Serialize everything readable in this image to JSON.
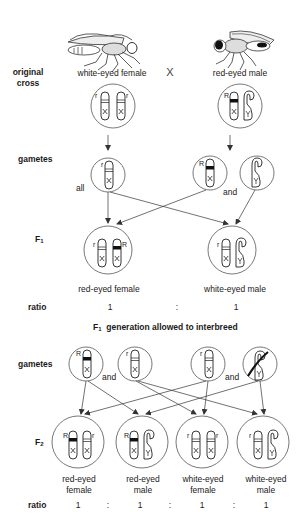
{
  "original_cross": {
    "row_label_line1": "original",
    "row_label_line2": "cross",
    "female_label": "white-eyed female",
    "cross_symbol": "X",
    "male_label": "red-eyed male",
    "female_fly_icon": "white-eyed-fly-icon",
    "male_fly_icon": "red-eyed-fly-icon",
    "female_chromosomes": [
      {
        "allele": "r",
        "type": "X"
      },
      {
        "allele": "r",
        "type": "X"
      }
    ],
    "male_chromosomes": [
      {
        "allele": "R",
        "type": "X"
      },
      {
        "allele": "",
        "type": "Y"
      }
    ]
  },
  "gametes_1": {
    "row_label": "gametes",
    "female_note": "all",
    "male_conjunction": "and",
    "female_gamete": {
      "allele": "r",
      "type": "X"
    },
    "male_gametes": [
      {
        "allele": "R",
        "type": "X"
      },
      {
        "allele": "",
        "type": "Y"
      }
    ]
  },
  "f1": {
    "row_label": "F",
    "row_label_sub": "1",
    "offspring": [
      {
        "label": "red-eyed female",
        "chromosomes": [
          {
            "allele": "r",
            "type": "X"
          },
          {
            "allele": "R",
            "type": "X"
          }
        ]
      },
      {
        "label": "white-eyed male",
        "chromosomes": [
          {
            "allele": "r",
            "type": "X"
          },
          {
            "allele": "",
            "type": "Y"
          }
        ]
      }
    ],
    "ratio_label": "ratio",
    "ratio_values": [
      "1",
      ":",
      "1"
    ]
  },
  "interbreed_heading": {
    "prefix": "F",
    "prefix_sub": "1",
    "text": "generation allowed to interbreed"
  },
  "gametes_2": {
    "row_label": "gametes",
    "conjunction_left": "and",
    "conjunction_right": "and",
    "gametes": [
      {
        "allele": "R",
        "type": "X"
      },
      {
        "allele": "r",
        "type": "X"
      },
      {
        "allele": "r",
        "type": "X"
      },
      {
        "allele": "",
        "type": "Y"
      }
    ]
  },
  "f2": {
    "row_label": "F",
    "row_label_sub": "2",
    "offspring": [
      {
        "label_line1": "red-eyed",
        "label_line2": "female",
        "chromosomes": [
          {
            "allele": "R",
            "type": "X"
          },
          {
            "allele": "r",
            "type": "X"
          }
        ]
      },
      {
        "label_line1": "red-eyed",
        "label_line2": "male",
        "chromosomes": [
          {
            "allele": "R",
            "type": "X"
          },
          {
            "allele": "",
            "type": "Y"
          }
        ]
      },
      {
        "label_line1": "white-eyed",
        "label_line2": "female",
        "chromosomes": [
          {
            "allele": "r",
            "type": "X"
          },
          {
            "allele": "r",
            "type": "X"
          }
        ]
      },
      {
        "label_line1": "white-eyed",
        "label_line2": "male",
        "chromosomes": [
          {
            "allele": "r",
            "type": "X"
          },
          {
            "allele": "",
            "type": "Y"
          }
        ]
      }
    ],
    "ratio_label": "ratio",
    "ratio_values": [
      "1",
      ":",
      "1",
      ":",
      "1",
      ":",
      "1"
    ]
  },
  "colors": {
    "line": "#333333",
    "circle": "#555555",
    "band_dominant": "#111111",
    "text": "#1a1a1a"
  }
}
